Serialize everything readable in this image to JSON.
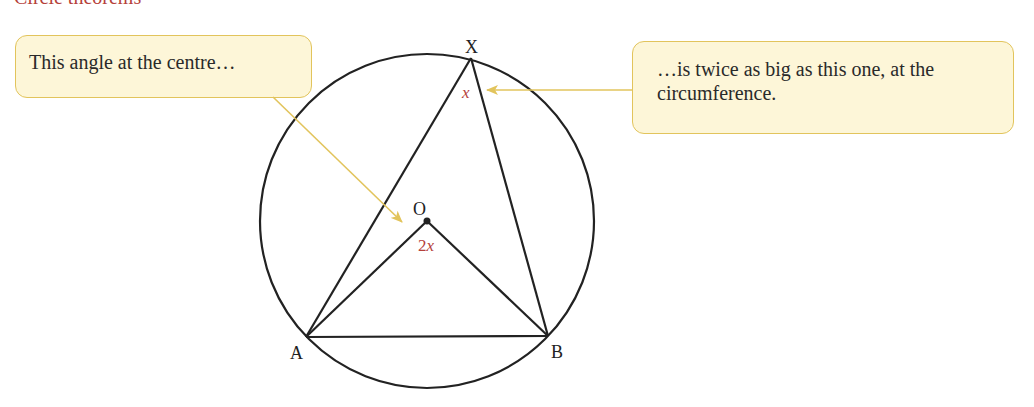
{
  "heading": {
    "text": "Circle theorems",
    "color": "#b5413a"
  },
  "callouts": {
    "left": {
      "text": "This angle at the centre…"
    },
    "right": {
      "text": "…is twice as big as this one, at the circumference."
    }
  },
  "diagram": {
    "circle": {
      "cx": 427,
      "cy": 221,
      "r": 167
    },
    "points": {
      "X": {
        "label": "X",
        "x": 471,
        "y": 58
      },
      "O": {
        "label": "O",
        "x": 427,
        "y": 221
      },
      "A": {
        "label": "A",
        "x": 306,
        "y": 337
      },
      "B": {
        "label": "B",
        "x": 548,
        "y": 336
      }
    },
    "angles": {
      "circumference": {
        "label": "x",
        "at": "X"
      },
      "centre": {
        "coef": "2",
        "var": "x",
        "at": "O"
      }
    },
    "colors": {
      "line": "#222222",
      "arrow": "#e2c45c",
      "callout_fill": "#fdf6d8",
      "callout_border": "#e2c45c",
      "angle_label": "#b5413a"
    }
  }
}
